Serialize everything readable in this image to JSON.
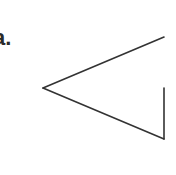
{
  "figure": {
    "label": "a.",
    "stroke_color": "#333333",
    "stroke_width": 1.6,
    "shape": "open-angle-with-vertical-segment",
    "vertex": [
      43,
      88
    ],
    "top_end": [
      164,
      37
    ],
    "bottom_end": [
      164,
      139
    ],
    "vertical_top": [
      164,
      88
    ]
  }
}
